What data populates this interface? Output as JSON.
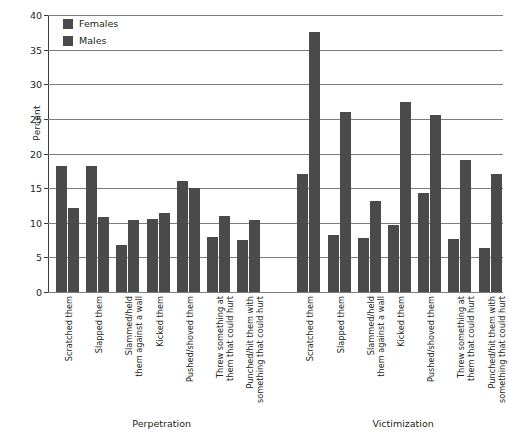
{
  "chart_data": {
    "type": "bar",
    "title": "",
    "xlabel": "",
    "ylabel": "Percent",
    "ylim": [
      0,
      40
    ],
    "yticks": [
      0,
      5,
      10,
      15,
      20,
      25,
      30,
      35,
      40
    ],
    "grid": true,
    "legend_position": "top-left",
    "legend": [
      "Females",
      "Males"
    ],
    "group_labels": [
      "Perpetration",
      "Victimization"
    ],
    "categories": [
      "Scratched them",
      "Slapped them",
      "Slammed/held them against a wall",
      "Kicked them",
      "Pushed/shoved them",
      "Threw something at them that could hurt",
      "Punched/hit them with something that could hurt"
    ],
    "groups": [
      {
        "name": "Perpetration",
        "series": [
          {
            "name": "Females",
            "values": [
              18.2,
              18.2,
              6.8,
              10.6,
              16.0,
              7.9,
              7.5
            ]
          },
          {
            "name": "Males",
            "values": [
              12.2,
              10.8,
              10.4,
              11.4,
              15.0,
              11.0,
              10.4
            ]
          }
        ]
      },
      {
        "name": "Victimization",
        "series": [
          {
            "name": "Females",
            "values": [
              17.0,
              8.2,
              7.8,
              9.7,
              14.3,
              7.7,
              6.3
            ]
          },
          {
            "name": "Males",
            "values": [
              37.5,
              26.0,
              13.2,
              27.5,
              25.5,
              19.0,
              17.0
            ]
          }
        ]
      }
    ],
    "colors": {
      "females": "#4a4a4a",
      "males": "#4a4a4a",
      "grid": "#7d7d7d",
      "axis": "#3b3b3b",
      "text": "#231f20",
      "background": "#ffffff"
    }
  },
  "category_label_lines": [
    [
      "Scratched them"
    ],
    [
      "Slapped them"
    ],
    [
      "Slammed/held",
      "them against a wall"
    ],
    [
      "Kicked them"
    ],
    [
      "Pushed/shoved them"
    ],
    [
      "Threw something at",
      "them that could hurt"
    ],
    [
      "Punched/hit them with",
      "something that could hurt"
    ]
  ]
}
